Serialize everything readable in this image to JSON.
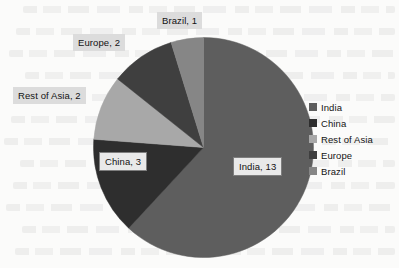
{
  "chart_data": {
    "type": "pie",
    "title": "",
    "subtitle": "",
    "xlabel": "",
    "ylabel": "",
    "total": 21,
    "legend_position": "right",
    "grid": false,
    "start_angle_deg": 0,
    "direction": "clockwise",
    "categories": [
      "India",
      "China",
      "Rest of Asia",
      "Europe",
      "Brazil"
    ],
    "values": [
      13,
      3,
      2,
      2,
      1
    ],
    "colors": [
      "#5e5e5e",
      "#2e2e2e",
      "#a8a8a8",
      "#3f3f3f",
      "#868686"
    ],
    "slices": [
      {
        "label": "India",
        "value": 13,
        "data_label": "India, 13",
        "color": "#5e5e5e",
        "angle_deg": 222.9
      },
      {
        "label": "China",
        "value": 3,
        "data_label": "China, 3",
        "color": "#2e2e2e",
        "angle_deg": 51.4
      },
      {
        "label": "Rest of Asia",
        "value": 2,
        "data_label": "Rest of Asia, 2",
        "color": "#a8a8a8",
        "angle_deg": 34.3
      },
      {
        "label": "Europe",
        "value": 2,
        "data_label": "Europe, 2",
        "color": "#3f3f3f",
        "angle_deg": 34.3
      },
      {
        "label": "Brazil",
        "value": 1,
        "data_label": "Brazil, 1",
        "color": "#868686",
        "angle_deg": 17.1
      }
    ],
    "legend": [
      {
        "label": "India",
        "color": "#5e5e5e"
      },
      {
        "label": "China",
        "color": "#2e2e2e"
      },
      {
        "label": "Rest of Asia",
        "color": "#a8a8a8"
      },
      {
        "label": "Europe",
        "color": "#3f3f3f"
      },
      {
        "label": "Brazil",
        "color": "#868686"
      }
    ]
  },
  "labels": {
    "india": "India, 13",
    "china": "China, 3",
    "rest_of_asia": "Rest of Asia, 2",
    "europe": "Europe, 2",
    "brazil": "Brazil, 1"
  }
}
